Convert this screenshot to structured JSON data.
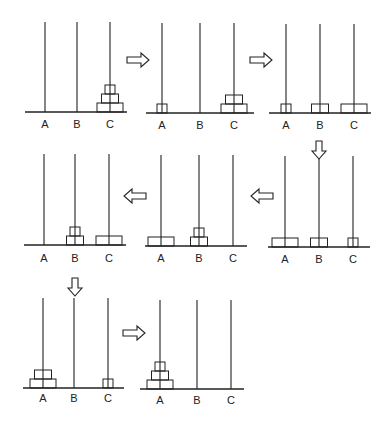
{
  "peg_labels": [
    "A",
    "B",
    "C"
  ],
  "disk_sizes": {
    "small": 1,
    "medium": 2,
    "large": 3
  },
  "panels": [
    {
      "step": 0,
      "pegs": {
        "A": [],
        "B": [],
        "C": [
          3,
          2,
          1
        ]
      }
    },
    {
      "step": 1,
      "pegs": {
        "A": [
          1
        ],
        "B": [],
        "C": [
          3,
          2
        ]
      }
    },
    {
      "step": 2,
      "pegs": {
        "A": [
          1
        ],
        "B": [
          2
        ],
        "C": [
          3
        ]
      }
    },
    {
      "step": 3,
      "pegs": {
        "A": [],
        "B": [
          2,
          1
        ],
        "C": [
          3
        ]
      }
    },
    {
      "step": 4,
      "pegs": {
        "A": [
          3
        ],
        "B": [
          2,
          1
        ],
        "C": []
      }
    },
    {
      "step": 5,
      "pegs": {
        "A": [
          3
        ],
        "B": [
          2
        ],
        "C": [
          1
        ]
      }
    },
    {
      "step": 6,
      "pegs": {
        "A": [
          3,
          2
        ],
        "B": [],
        "C": [
          1
        ]
      }
    },
    {
      "step": 7,
      "pegs": {
        "A": [
          3,
          2,
          1
        ],
        "B": [],
        "C": []
      }
    }
  ],
  "arrows": [
    {
      "from": 0,
      "to": 1,
      "direction": "right"
    },
    {
      "from": 1,
      "to": 2,
      "direction": "right"
    },
    {
      "from": 2,
      "to": 3,
      "direction": "down"
    },
    {
      "from": 3,
      "to": 4,
      "direction": "left"
    },
    {
      "from": 4,
      "to": 5,
      "direction": "left"
    },
    {
      "from": 5,
      "to": 6,
      "direction": "down"
    },
    {
      "from": 6,
      "to": 7,
      "direction": "right"
    }
  ],
  "colors": {
    "line": "#222222",
    "background": "#ffffff"
  }
}
